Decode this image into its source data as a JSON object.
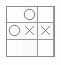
{
  "board": {
    "title": "tic-tac-toe-board",
    "rows": 3,
    "columns": 3,
    "line_color": "#9a9a9a",
    "border_color": "#8c8c8c",
    "background_color": "#fdfdfd",
    "mark_color": "#7a7a7a",
    "cells": [
      {
        "row": 0,
        "col": 0,
        "mark": "",
        "label": "empty"
      },
      {
        "row": 0,
        "col": 1,
        "mark": "O",
        "label": "O"
      },
      {
        "row": 0,
        "col": 2,
        "mark": "",
        "label": "empty"
      },
      {
        "row": 1,
        "col": 0,
        "mark": "O",
        "label": "O"
      },
      {
        "row": 1,
        "col": 1,
        "mark": "X",
        "label": "X"
      },
      {
        "row": 1,
        "col": 2,
        "mark": "X",
        "label": "X"
      },
      {
        "row": 2,
        "col": 0,
        "mark": "",
        "label": "empty"
      },
      {
        "row": 2,
        "col": 1,
        "mark": "",
        "label": "empty"
      },
      {
        "row": 2,
        "col": 2,
        "mark": "",
        "label": "empty"
      }
    ]
  }
}
